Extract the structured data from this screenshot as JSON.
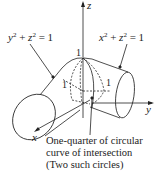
{
  "diagram": {
    "labels": {
      "z_axis": "z",
      "x_axis": "x",
      "y_axis": "y",
      "eq_left": {
        "v1": "y",
        "v2": "z",
        "rhs": "= 1",
        "plus": "+",
        "exp": "2"
      },
      "eq_right": {
        "v1": "x",
        "v2": "z",
        "rhs": "= 1",
        "plus": "+",
        "exp": "2"
      },
      "one_top": "1",
      "one_left": "1",
      "one_right": "1"
    },
    "caption": {
      "line1": "One-quarter of circular",
      "line2": "curve of intersection",
      "line3": "(Two such circles)"
    },
    "colors": {
      "stroke": "#222222",
      "background": "#ffffff"
    }
  }
}
